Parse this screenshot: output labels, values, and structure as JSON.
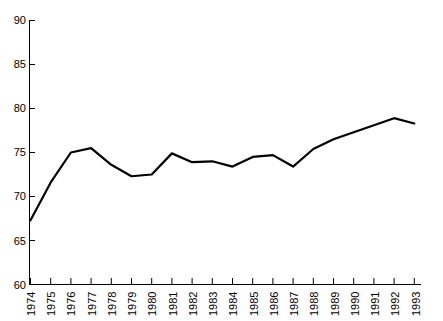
{
  "chart_data": {
    "type": "line",
    "title": "",
    "subtitle": "",
    "xlabel": "",
    "ylabel": "",
    "x": [
      1974,
      1975,
      1976,
      1977,
      1978,
      1979,
      1980,
      1981,
      1982,
      1983,
      1984,
      1985,
      1986,
      1987,
      1988,
      1989,
      1990,
      1991,
      1992,
      1993
    ],
    "categories": [
      "1974",
      "1975",
      "1976",
      "1977",
      "1978",
      "1979",
      "1980",
      "1981",
      "1982",
      "1983",
      "1984",
      "1985",
      "1986",
      "1987",
      "1988",
      "1989",
      "1990",
      "1991",
      "1992",
      "1993"
    ],
    "values": [
      67.3,
      71.6,
      75.0,
      75.5,
      73.6,
      72.3,
      72.5,
      74.9,
      73.9,
      74.0,
      73.4,
      74.5,
      74.7,
      73.4,
      75.4,
      76.5,
      77.3,
      78.1,
      78.9,
      78.3
    ],
    "series": [
      {
        "name": "series-1",
        "values": [
          67.3,
          71.6,
          75.0,
          75.5,
          73.6,
          72.3,
          72.5,
          74.9,
          73.9,
          74.0,
          73.4,
          74.5,
          74.7,
          73.4,
          75.4,
          76.5,
          77.3,
          78.1,
          78.9,
          78.3
        ],
        "color": "#000000"
      }
    ],
    "ylim": [
      60,
      90
    ],
    "yticks": [
      60,
      65,
      70,
      75,
      80,
      85,
      90
    ],
    "ytick_labels": [
      "60",
      "65",
      "70",
      "75",
      "80",
      "85",
      "90"
    ],
    "xtick_labels": [
      "1974",
      "1975",
      "1976",
      "1977",
      "1978",
      "1979",
      "1980",
      "1981",
      "1982",
      "1983",
      "1984",
      "1985",
      "1986",
      "1987",
      "1988",
      "1989",
      "1990",
      "1991",
      "1992",
      "1993"
    ],
    "grid": false,
    "legend": null,
    "legend_position": "none",
    "line_color": "#000000",
    "axis_color": "#000000",
    "background_color": "#ffffff"
  }
}
